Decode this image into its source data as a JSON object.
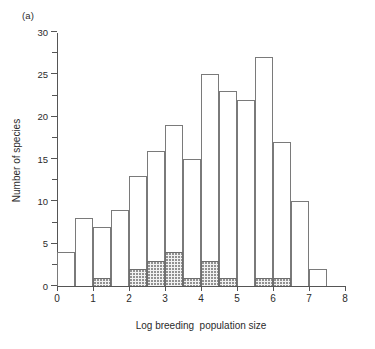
{
  "figure": {
    "panel_label": "(a)"
  },
  "chart_data": {
    "type": "bar",
    "title": "",
    "xlabel": "Log breeding  population size",
    "ylabel": "Number of species",
    "xlim": [
      0,
      8
    ],
    "ylim": [
      0,
      30
    ],
    "bin_width": 0.5,
    "grid": false,
    "legend": false,
    "xticks": [
      0,
      1,
      2,
      3,
      4,
      5,
      6,
      7,
      8
    ],
    "xtick_labels": [
      "0",
      "1",
      "2",
      "3",
      "4",
      "5",
      "6",
      "7",
      "8"
    ],
    "yticks": [
      0,
      5,
      10,
      15,
      20,
      25,
      30
    ],
    "ytick_labels": [
      "0",
      "5",
      "10",
      "15",
      "20",
      "25",
      "30"
    ],
    "yticks_minor": [
      2.5,
      7.5,
      12.5,
      17.5,
      22.5,
      27.5
    ],
    "bin_starts": [
      0,
      0.5,
      1,
      1.5,
      2,
      2.5,
      3,
      3.5,
      4,
      4.5,
      5,
      5.5,
      6,
      6.5,
      7
    ],
    "series": [
      {
        "name": "Total number of species",
        "style": "open",
        "values": [
          4,
          8,
          7,
          9,
          13,
          16,
          19,
          15,
          25,
          23,
          22,
          27,
          17,
          10,
          2
        ]
      },
      {
        "name": "Shaded subset",
        "style": "stippled",
        "values": [
          0,
          0,
          1,
          0,
          2,
          3,
          4,
          1,
          3,
          1,
          0,
          1,
          1,
          0,
          0
        ]
      }
    ]
  }
}
